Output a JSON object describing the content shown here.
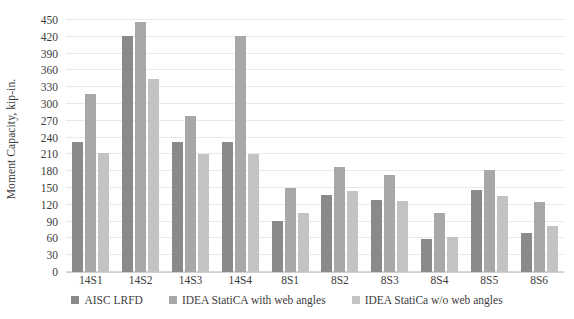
{
  "chart_data": {
    "type": "bar",
    "title": "",
    "xlabel": "",
    "ylabel": "Moment Capacity, kip-in.",
    "ylim": [
      0,
      450
    ],
    "ytick_step": 30,
    "yticks": [
      0,
      30,
      60,
      90,
      120,
      150,
      180,
      210,
      240,
      270,
      300,
      330,
      360,
      390,
      420,
      450
    ],
    "grid": true,
    "legend_position": "bottom",
    "categories": [
      "14S1",
      "14S2",
      "14S3",
      "14S4",
      "8S1",
      "8S2",
      "8S3",
      "8S4",
      "8S5",
      "8S6"
    ],
    "series": [
      {
        "name": "AISC LRFD",
        "color": "#8a8a8a",
        "values": [
          232,
          421,
          232,
          232,
          91,
          137,
          128,
          59,
          147,
          69
        ]
      },
      {
        "name": "IDEA StatiCA with web angles",
        "color": "#a8a8a8",
        "values": [
          318,
          447,
          278,
          421,
          150,
          188,
          174,
          106,
          182,
          125
        ]
      },
      {
        "name": "IDEA StatiCa w/o web angles",
        "color": "#c3c3c3",
        "values": [
          212,
          344,
          211,
          211,
          105,
          145,
          126,
          63,
          135,
          82
        ]
      }
    ]
  },
  "axis": {
    "y_title": "Moment Capacity, kip-in."
  },
  "colors": {
    "series_0": "#8a8a8a",
    "series_1": "#a8a8a8",
    "series_2": "#c3c3c3",
    "gridline": "#e9e9e9",
    "text": "#3d3d3d",
    "background": "#ffffff"
  }
}
